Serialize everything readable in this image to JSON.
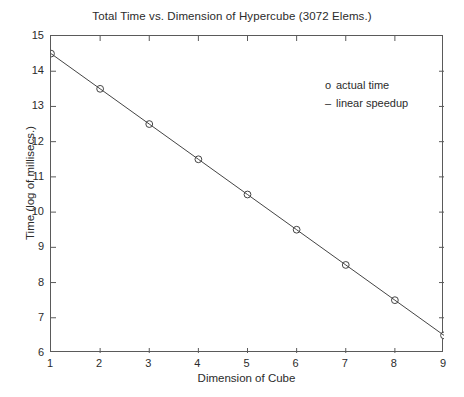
{
  "chart_data": {
    "type": "line",
    "title": "Total Time vs. Dimension of Hypercube (3072 Elems.)",
    "xlabel": "Dimension of Cube",
    "ylabel": "Time (log of millisecs.)",
    "xlim": [
      1,
      9
    ],
    "ylim": [
      6,
      15
    ],
    "xticks": [
      1,
      2,
      3,
      4,
      5,
      6,
      7,
      8,
      9
    ],
    "yticks": [
      6,
      7,
      8,
      9,
      10,
      11,
      12,
      13,
      14,
      15
    ],
    "grid": false,
    "legend_position": "upper-right",
    "x": [
      1,
      2,
      3,
      4,
      5,
      6,
      7,
      8,
      9
    ],
    "series": [
      {
        "name": "actual time",
        "marker": "o",
        "values": [
          14.5,
          13.5,
          12.5,
          11.5,
          10.5,
          9.5,
          8.5,
          7.5,
          6.5
        ]
      },
      {
        "name": "linear speedup",
        "marker": "-",
        "values": [
          14.5,
          13.5,
          12.5,
          11.5,
          10.5,
          9.5,
          8.5,
          7.5,
          6.5
        ]
      }
    ]
  },
  "legend": {
    "entries": [
      {
        "marker": "o",
        "label": "actual time"
      },
      {
        "marker": "–",
        "label": "linear speedup"
      }
    ]
  },
  "colors": {
    "line": "#444444",
    "marker_stroke": "#444444",
    "marker_fill": "#ffffff",
    "axis": "#5a5a5a",
    "text": "#2b2b2b",
    "background": "#ffffff"
  }
}
